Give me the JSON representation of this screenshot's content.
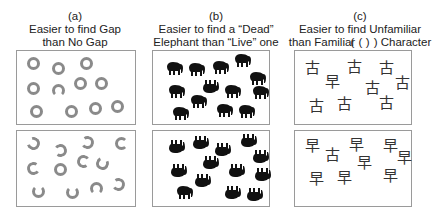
{
  "panels": [
    {
      "label": "(a)",
      "line1": "Easier to find Gap",
      "line2": "than No Gap"
    },
    {
      "label": "(b)",
      "line1": "Easier to find a “Dead”",
      "line2": "Elephant than “Live” one"
    },
    {
      "label": "(c)",
      "line1": "Easier to find Unfamiliar ( )",
      "line2": "than Familiar ( ) Character"
    }
  ],
  "characters": {
    "familiar": "古",
    "unfamiliar": "早"
  }
}
